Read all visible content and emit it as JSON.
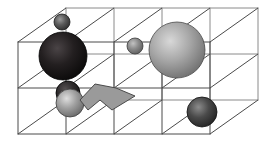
{
  "figure": {
    "type": "3d-wireframe-scene",
    "width": 266,
    "height": 141,
    "background_color": "#ffffff",
    "projection": "oblique-parallel"
  },
  "grid": {
    "label": "wireframe-box",
    "line_color": "#4a4a4a",
    "line_color_back": "#8a8a8a",
    "line_width": 1,
    "columns": 4,
    "rows": 2,
    "depth_layers": 2,
    "front_face": {
      "x": 18,
      "y": 42,
      "width": 192,
      "height": 92
    },
    "depth_offset": {
      "dx": 48,
      "dy": -34
    }
  },
  "objects": [
    {
      "name": "sphere-small-top-left",
      "shape": "sphere",
      "cx": 62,
      "cy": 22,
      "r": 8,
      "fill": "#5a5a5a",
      "highlight": "#9a9a9a",
      "shade": "#2c2c2c",
      "stroke": "#1a1a1a"
    },
    {
      "name": "sphere-large-dark-left",
      "shape": "sphere",
      "cx": 63,
      "cy": 56,
      "r": 24,
      "fill": "#231f20",
      "highlight": "#4a4446",
      "shade": "#0a0909",
      "stroke": "#000000"
    },
    {
      "name": "sphere-small-middle",
      "shape": "sphere",
      "cx": 135,
      "cy": 46,
      "r": 8,
      "fill": "#8b8b8b",
      "highlight": "#c2c2c2",
      "shade": "#5c5c5c",
      "stroke": "#3a3a3a"
    },
    {
      "name": "sphere-large-light-right",
      "shape": "sphere",
      "cx": 177,
      "cy": 50,
      "r": 28,
      "fill": "#a8a8a8",
      "highlight": "#d8d8d8",
      "shade": "#6e6e6e",
      "stroke": "#4a4a4a"
    },
    {
      "name": "sphere-dark-back-lower-left",
      "shape": "sphere",
      "cx": 68,
      "cy": 93,
      "r": 12,
      "fill": "#2e2b2c",
      "highlight": "#565152",
      "shade": "#121011",
      "stroke": "#000000"
    },
    {
      "name": "sphere-light-front-lower-left",
      "shape": "sphere",
      "cx": 70,
      "cy": 103,
      "r": 14,
      "fill": "#a0a0a0",
      "highlight": "#dedede",
      "shade": "#676767",
      "stroke": "#3f3f3f"
    },
    {
      "name": "arrow-polygon-marker",
      "shape": "polygon",
      "points": "80,100 95,84 116,88 135,96 112,110 100,100 88,110",
      "fill": "#9a9a9a",
      "fill_dark": "#7c7c7c",
      "stroke": "#4a4a4a"
    },
    {
      "name": "sphere-dark-bottom-right",
      "shape": "sphere",
      "cx": 202,
      "cy": 112,
      "r": 15,
      "fill": "#4a4a4a",
      "highlight": "#8c8c8c",
      "shade": "#222222",
      "stroke": "#111111"
    }
  ]
}
